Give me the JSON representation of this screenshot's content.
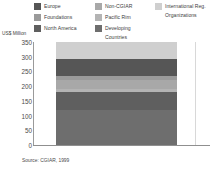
{
  "chart_data": {
    "type": "bar",
    "title": "",
    "subtitle": "",
    "xlabel": "",
    "ylabel": "US$ Million",
    "ylim": [
      0,
      350
    ],
    "yticks": [
      0,
      50,
      100,
      150,
      200,
      250,
      300,
      350
    ],
    "grid": false,
    "stacked": true,
    "legend_position": "top",
    "categories": [
      "1999"
    ],
    "series": [
      {
        "name": "Developing Countries",
        "values": [
          136
        ],
        "color": "#6e6e6e"
      },
      {
        "name": "North America",
        "values": [
          68
        ],
        "color": "#5f5f5f"
      },
      {
        "name": "Pacific Rim",
        "values": [
          10
        ],
        "color": "#b4b4b4"
      },
      {
        "name": "Non-CGIAR",
        "values": [
          34
        ],
        "color": "#a8a8a8"
      },
      {
        "name": "Foundations",
        "values": [
          17
        ],
        "color": "#9a9a9a"
      },
      {
        "name": "Europe",
        "values": [
          65
        ],
        "color": "#565656"
      },
      {
        "name": "International Reg. Organizations",
        "values": [
          65
        ],
        "color": "#cfcfcf"
      }
    ],
    "total": 330,
    "source": "Source: CGIAR, 1999"
  },
  "legend": {
    "columns": [
      {
        "items": [
          {
            "label": "Europe",
            "color": "#565656"
          },
          {
            "label": "Foundations",
            "color": "#9a9a9a"
          },
          {
            "label": "North America",
            "color": "#5f5f5f"
          }
        ]
      },
      {
        "items": [
          {
            "label": "Non-CGIAR",
            "color": "#a8a8a8"
          },
          {
            "label": "Pacific Rim",
            "color": "#b4b4b4"
          },
          {
            "label": "Developing Countries",
            "color": "#6e6e6e"
          }
        ]
      },
      {
        "items": [
          {
            "label": "International Reg.\nOrganizations",
            "color": "#cfcfcf"
          }
        ]
      }
    ]
  },
  "axis": {
    "y_title": "US$ Million",
    "ticks": [
      "350",
      "300",
      "250",
      "200",
      "150",
      "100",
      "50",
      "0"
    ]
  },
  "footer": {
    "source": "Source: CGIAR, 1999"
  },
  "colors": {
    "axis_line": "#8f8f8f",
    "text": "#3d3d3d",
    "background": "#ffffff"
  }
}
